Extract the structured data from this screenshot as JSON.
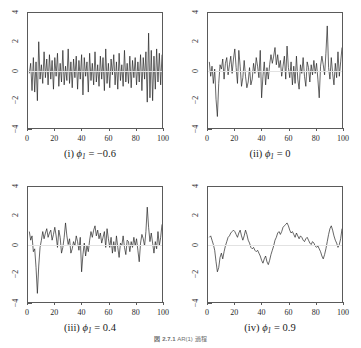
{
  "figure": {
    "caption": "図 2.7.1　AR(1) 過程",
    "caption_label": "図 2.7.1",
    "caption_text": "AR(1) 過程"
  },
  "axes": {
    "x_ticks": [
      "0",
      "20",
      "40",
      "60",
      "80",
      "100"
    ],
    "y_ticks": [
      "-4",
      "-2",
      "0",
      "2",
      "4"
    ],
    "xlim": [
      0,
      100
    ],
    "ylim": [
      -4,
      4
    ]
  },
  "panels": [
    {
      "id": "panel-i",
      "caption_index": "(i)",
      "caption_param": "ϕ",
      "caption_sub": "1",
      "caption_value": "= −0.6",
      "caption_full": "(i) ϕ₁ = −0.6",
      "phi": -0.6
    },
    {
      "id": "panel-ii",
      "caption_index": "(ii)",
      "caption_param": "ϕ",
      "caption_sub": "1",
      "caption_value": "= 0",
      "caption_full": "(ii) ϕ₁ = 0",
      "phi": 0
    },
    {
      "id": "panel-iii",
      "caption_index": "(iii)",
      "caption_param": "ϕ",
      "caption_sub": "1",
      "caption_value": "= 0.4",
      "caption_full": "(iii) ϕ₁ = 0.4",
      "phi": 0.4
    },
    {
      "id": "panel-iv",
      "caption_index": "(iv)",
      "caption_param": "ϕ",
      "caption_sub": "1",
      "caption_value": "= 0.9",
      "caption_full": "(iv) ϕ₁ = 0.9",
      "phi": 0.9
    }
  ],
  "chart_data": [
    {
      "type": "line",
      "title": "(i) ϕ₁ = −0.6",
      "xlabel": "",
      "ylabel": "",
      "xlim": [
        0,
        100
      ],
      "ylim": [
        -4,
        4
      ],
      "grid": false,
      "legend": "none",
      "xticks": [
        0,
        20,
        40,
        60,
        80,
        100
      ],
      "yticks": [
        -4,
        -2,
        0,
        2,
        4
      ],
      "x": [
        1,
        2,
        3,
        4,
        5,
        6,
        7,
        8,
        9,
        10,
        11,
        12,
        13,
        14,
        15,
        16,
        17,
        18,
        19,
        20,
        21,
        22,
        23,
        24,
        25,
        26,
        27,
        28,
        29,
        30,
        31,
        32,
        33,
        34,
        35,
        36,
        37,
        38,
        39,
        40,
        41,
        42,
        43,
        44,
        45,
        46,
        47,
        48,
        49,
        50,
        51,
        52,
        53,
        54,
        55,
        56,
        57,
        58,
        59,
        60,
        61,
        62,
        63,
        64,
        65,
        66,
        67,
        68,
        69,
        70,
        71,
        72,
        73,
        74,
        75,
        76,
        77,
        78,
        79,
        80,
        81,
        82,
        83,
        84,
        85,
        86,
        87,
        88,
        89,
        90,
        91,
        92,
        93,
        94,
        95,
        96,
        97,
        98,
        99,
        100
      ],
      "values": [
        -0.2,
        0.5,
        -1.4,
        0.9,
        -1.5,
        0.6,
        -2.1,
        2.0,
        -0.6,
        0.4,
        -0.9,
        1.3,
        -0.5,
        0.8,
        -1.0,
        1.1,
        -0.6,
        0.7,
        -1.3,
        0.9,
        -0.4,
        1.2,
        -1.1,
        0.5,
        -0.8,
        1.4,
        -1.0,
        0.3,
        -0.7,
        1.5,
        -0.9,
        0.6,
        -1.2,
        0.8,
        -0.5,
        1.0,
        -1.3,
        0.7,
        -0.6,
        1.1,
        -1.7,
        0.9,
        -0.4,
        0.6,
        -1.5,
        1.2,
        -0.7,
        0.5,
        -1.0,
        1.3,
        -0.8,
        0.4,
        -1.1,
        1.0,
        -0.6,
        0.9,
        -1.4,
        1.5,
        -0.9,
        0.5,
        -1.2,
        0.8,
        -0.3,
        1.1,
        -1.0,
        0.6,
        -1.3,
        1.2,
        -0.7,
        0.4,
        -1.1,
        1.4,
        -0.8,
        0.5,
        -0.9,
        1.0,
        -1.2,
        0.7,
        -0.5,
        0.9,
        -1.0,
        0.6,
        -0.8,
        1.1,
        -1.4,
        0.9,
        -0.6,
        1.3,
        -2.2,
        2.6,
        -1.9,
        1.4,
        -2.1,
        1.0,
        -1.3,
        1.5,
        -0.8,
        1.2,
        -1.0,
        1.1
      ]
    },
    {
      "type": "line",
      "title": "(ii) ϕ₁ = 0",
      "xlabel": "",
      "ylabel": "",
      "xlim": [
        0,
        100
      ],
      "ylim": [
        -4,
        4
      ],
      "grid": false,
      "legend": "none",
      "xticks": [
        0,
        20,
        40,
        60,
        80,
        100
      ],
      "yticks": [
        -4,
        -2,
        0,
        2,
        4
      ],
      "x": [
        1,
        2,
        3,
        4,
        5,
        6,
        7,
        8,
        9,
        10,
        11,
        12,
        13,
        14,
        15,
        16,
        17,
        18,
        19,
        20,
        21,
        22,
        23,
        24,
        25,
        26,
        27,
        28,
        29,
        30,
        31,
        32,
        33,
        34,
        35,
        36,
        37,
        38,
        39,
        40,
        41,
        42,
        43,
        44,
        45,
        46,
        47,
        48,
        49,
        50,
        51,
        52,
        53,
        54,
        55,
        56,
        57,
        58,
        59,
        60,
        61,
        62,
        63,
        64,
        65,
        66,
        67,
        68,
        69,
        70,
        71,
        72,
        73,
        74,
        75,
        76,
        77,
        78,
        79,
        80,
        81,
        82,
        83,
        84,
        85,
        86,
        87,
        88,
        89,
        90,
        91,
        92,
        93,
        94,
        95,
        96,
        97,
        98,
        99,
        100
      ],
      "values": [
        0.6,
        -0.4,
        0.3,
        -0.9,
        0.1,
        -2.0,
        -3.2,
        -0.9,
        0.4,
        0.1,
        0.8,
        -0.6,
        0.5,
        0.9,
        -0.3,
        0.4,
        1.0,
        -0.2,
        0.8,
        1.5,
        0.2,
        -0.9,
        1.4,
        0.3,
        -1.1,
        -0.5,
        0.7,
        -0.4,
        -1.2,
        -0.8,
        0.2,
        -1.0,
        -0.6,
        0.5,
        -0.2,
        0.9,
        0.3,
        -0.5,
        1.4,
        -1.9,
        -0.4,
        0.6,
        -1.0,
        0.2,
        -0.6,
        0.4,
        1.1,
        0.5,
        1.0,
        1.6,
        0.4,
        1.1,
        0.2,
        0.7,
        -0.4,
        0.3,
        1.0,
        -0.6,
        1.7,
        0.2,
        -0.5,
        0.6,
        -1.0,
        0.3,
        -0.9,
        1.0,
        -0.6,
        -1.3,
        0.4,
        -0.2,
        0.9,
        -0.4,
        -1.1,
        0.6,
        0.2,
        -0.8,
        0.4,
        -0.3,
        0.7,
        -0.2,
        0.5,
        -0.6,
        -1.9,
        0.3,
        1.0,
        0.4,
        -0.3,
        1.2,
        3.1,
        0.2,
        -0.6,
        0.9,
        -0.2,
        -1.0,
        0.5,
        -0.5,
        1.3,
        -0.4,
        0.6,
        1.6
      ]
    },
    {
      "type": "line",
      "title": "(iii) ϕ₁ = 0.4",
      "xlabel": "",
      "ylabel": "",
      "xlim": [
        0,
        100
      ],
      "ylim": [
        -4,
        4
      ],
      "grid": false,
      "legend": "none",
      "xticks": [
        0,
        20,
        40,
        60,
        80,
        100
      ],
      "yticks": [
        -4,
        -2,
        0,
        2,
        4
      ],
      "x": [
        1,
        2,
        3,
        4,
        5,
        6,
        7,
        8,
        9,
        10,
        11,
        12,
        13,
        14,
        15,
        16,
        17,
        18,
        19,
        20,
        21,
        22,
        23,
        24,
        25,
        26,
        27,
        28,
        29,
        30,
        31,
        32,
        33,
        34,
        35,
        36,
        37,
        38,
        39,
        40,
        41,
        42,
        43,
        44,
        45,
        46,
        47,
        48,
        49,
        50,
        51,
        52,
        53,
        54,
        55,
        56,
        57,
        58,
        59,
        60,
        61,
        62,
        63,
        64,
        65,
        66,
        67,
        68,
        69,
        70,
        71,
        72,
        73,
        74,
        75,
        76,
        77,
        78,
        79,
        80,
        81,
        82,
        83,
        84,
        85,
        86,
        87,
        88,
        89,
        90,
        91,
        92,
        93,
        94,
        95,
        96,
        97,
        98,
        99,
        100
      ],
      "values": [
        0.9,
        0.3,
        0.6,
        -0.5,
        -0.3,
        -1.6,
        -3.4,
        -1.5,
        -0.2,
        0.3,
        0.9,
        0.4,
        0.8,
        1.1,
        0.5,
        0.8,
        1.0,
        0.3,
        0.7,
        1.2,
        0.6,
        -0.2,
        1.0,
        0.5,
        -0.6,
        -0.2,
        0.5,
        1.5,
        0.6,
        0.0,
        0.4,
        -0.6,
        -0.3,
        0.2,
        -0.1,
        0.6,
        0.2,
        -0.4,
        0.5,
        -1.9,
        -0.7,
        0.1,
        -0.8,
        -0.1,
        -0.5,
        0.3,
        0.9,
        0.5,
        1.0,
        1.3,
        0.6,
        1.0,
        0.4,
        0.8,
        0.1,
        0.5,
        0.9,
        -0.2,
        1.1,
        0.4,
        -0.2,
        0.5,
        -0.6,
        0.2,
        -0.5,
        0.6,
        -0.2,
        -0.9,
        0.1,
        -0.1,
        0.6,
        -0.2,
        -0.7,
        0.3,
        0.2,
        -0.5,
        0.2,
        -0.2,
        0.5,
        -0.1,
        0.4,
        -0.4,
        -1.2,
        0.1,
        0.7,
        0.4,
        -0.1,
        0.9,
        2.6,
        1.2,
        0.2,
        0.8,
        0.1,
        -0.6,
        0.2,
        -0.3,
        0.9,
        -0.1,
        0.5,
        1.4
      ]
    },
    {
      "type": "line",
      "title": "(iv) ϕ₁ = 0.9",
      "xlabel": "",
      "ylabel": "",
      "xlim": [
        0,
        100
      ],
      "ylim": [
        -4,
        4
      ],
      "grid": false,
      "legend": "none",
      "xticks": [
        0,
        20,
        40,
        60,
        80,
        100
      ],
      "yticks": [
        -4,
        -2,
        0,
        2,
        4
      ],
      "x": [
        1,
        2,
        3,
        4,
        5,
        6,
        7,
        8,
        9,
        10,
        11,
        12,
        13,
        14,
        15,
        16,
        17,
        18,
        19,
        20,
        21,
        22,
        23,
        24,
        25,
        26,
        27,
        28,
        29,
        30,
        31,
        32,
        33,
        34,
        35,
        36,
        37,
        38,
        39,
        40,
        41,
        42,
        43,
        44,
        45,
        46,
        47,
        48,
        49,
        50,
        51,
        52,
        53,
        54,
        55,
        56,
        57,
        58,
        59,
        60,
        61,
        62,
        63,
        64,
        65,
        66,
        67,
        68,
        69,
        70,
        71,
        72,
        73,
        74,
        75,
        76,
        77,
        78,
        79,
        80,
        81,
        82,
        83,
        84,
        85,
        86,
        87,
        88,
        89,
        90,
        91,
        92,
        93,
        94,
        95,
        96,
        97,
        98,
        99,
        100
      ],
      "values": [
        0.5,
        0.6,
        0.3,
        0.0,
        -0.4,
        -1.2,
        -1.9,
        -1.6,
        -0.9,
        -0.6,
        -1.0,
        -0.5,
        -0.1,
        0.2,
        0.5,
        0.6,
        0.8,
        0.9,
        1.0,
        0.9,
        0.7,
        0.5,
        0.8,
        1.0,
        0.6,
        0.3,
        0.6,
        1.0,
        0.7,
        0.3,
        0.1,
        -0.2,
        -0.3,
        -0.2,
        -0.4,
        -0.5,
        -0.4,
        -0.6,
        -0.8,
        -1.1,
        -1.3,
        -1.0,
        -0.8,
        -1.2,
        -1.4,
        -1.1,
        -0.7,
        -0.4,
        -0.1,
        0.3,
        0.5,
        0.8,
        0.9,
        0.7,
        0.9,
        1.2,
        1.3,
        1.4,
        1.5,
        1.3,
        1.0,
        0.8,
        0.9,
        0.7,
        0.5,
        0.8,
        0.6,
        0.4,
        0.6,
        0.5,
        0.3,
        0.2,
        0.4,
        0.5,
        0.3,
        0.1,
        0.0,
        0.2,
        0.1,
        -0.1,
        -0.2,
        -0.1,
        -0.3,
        -0.5,
        -0.8,
        -1.0,
        -0.7,
        -0.3,
        0.2,
        0.7,
        1.1,
        1.3,
        1.0,
        0.6,
        0.3,
        0.1,
        -0.2,
        0.0,
        0.4,
        1.1
      ]
    }
  ]
}
